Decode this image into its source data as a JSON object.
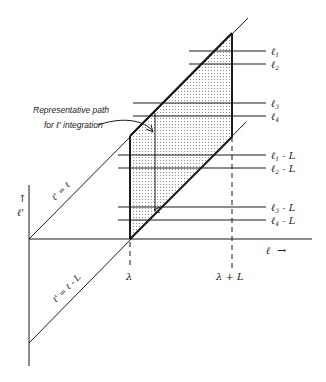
{
  "figure": {
    "annotation": {
      "line1": "Representative path",
      "line2": "for ℓ' integration"
    },
    "axes": {
      "x_label": "ℓ",
      "y_label": "ℓ'",
      "x_arrow": "→",
      "y_arrow": "↑"
    },
    "diagonals": {
      "upper": "ℓ' = ℓ",
      "lower": "ℓ' = ℓ - L"
    },
    "ticks": {
      "lambda": "λ",
      "lambda_plus_L": "λ + L"
    },
    "levels_upper": [
      {
        "label": "ℓ",
        "sub": "1"
      },
      {
        "label": "ℓ",
        "sub": "2"
      },
      {
        "label": "ℓ",
        "sub": "3"
      },
      {
        "label": "ℓ",
        "sub": "4"
      }
    ],
    "levels_lower": [
      {
        "label": "ℓ",
        "sub": "1",
        "suffix": " - L"
      },
      {
        "label": "ℓ",
        "sub": "2",
        "suffix": " - L"
      },
      {
        "label": "ℓ",
        "sub": "3",
        "suffix": " - L"
      },
      {
        "label": "ℓ",
        "sub": "4",
        "suffix": " - L"
      }
    ],
    "colors": {
      "line": "#1a1a1a",
      "shading_dot": "#8a8a8a",
      "background": "#ffffff"
    }
  }
}
